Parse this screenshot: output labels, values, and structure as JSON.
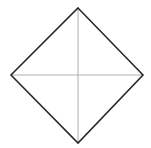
{
  "diagram": {
    "shape": "diamond",
    "vertices": {
      "top": [
        78,
        8
      ],
      "right": [
        143,
        75
      ],
      "bottom": [
        78,
        143
      ],
      "left": [
        11,
        75
      ]
    },
    "center": [
      78,
      75
    ],
    "colors": {
      "outline": "#2a2a2a",
      "diagonals": "#b0b0b0",
      "background": "#ffffff"
    }
  }
}
